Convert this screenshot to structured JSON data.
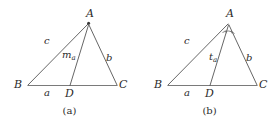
{
  "figure_style": {
    "stroke_color": "#555555",
    "text_color": "#2b2b2b",
    "background": "#ffffff",
    "stroke_width": 0.9
  },
  "figures": [
    {
      "id": "a",
      "caption": "(a)",
      "description": "Triangle ABC with median from A to midpoint D of BC",
      "vertices": {
        "A": {
          "label": "A",
          "x": 90,
          "y": 20
        },
        "B": {
          "label": "B",
          "x": 22,
          "y": 86
        },
        "C": {
          "label": "C",
          "x": 120,
          "y": 86
        },
        "D": {
          "label": "D",
          "x": 70,
          "y": 86
        }
      },
      "side_labels": [
        {
          "name": "c",
          "label": "c",
          "x": 46,
          "y": 41
        },
        {
          "name": "b",
          "label": "b",
          "x": 108,
          "y": 58
        },
        {
          "name": "a",
          "label": "a",
          "x": 46,
          "y": 92
        }
      ],
      "cevian": {
        "name": "median",
        "label_main": "m",
        "label_sub": "a",
        "x": 66,
        "y": 55
      },
      "vertex_dot": true,
      "angle_mark": false
    },
    {
      "id": "b",
      "caption": "(b)",
      "description": "Triangle ABC with angle bisector from A to D on BC",
      "vertices": {
        "A": {
          "label": "A",
          "x": 90,
          "y": 20
        },
        "B": {
          "label": "B",
          "x": 22,
          "y": 86
        },
        "C": {
          "label": "C",
          "x": 120,
          "y": 86
        },
        "D": {
          "label": "D",
          "x": 70,
          "y": 86
        }
      },
      "side_labels": [
        {
          "name": "c",
          "label": "c",
          "x": 46,
          "y": 41
        },
        {
          "name": "b",
          "label": "b",
          "x": 108,
          "y": 58
        },
        {
          "name": "a",
          "label": "a",
          "x": 46,
          "y": 92
        }
      ],
      "cevian": {
        "name": "angle-bisector",
        "label_main": "t",
        "label_sub": "a",
        "x": 72,
        "y": 57
      },
      "vertex_dot": false,
      "angle_mark": true
    }
  ]
}
